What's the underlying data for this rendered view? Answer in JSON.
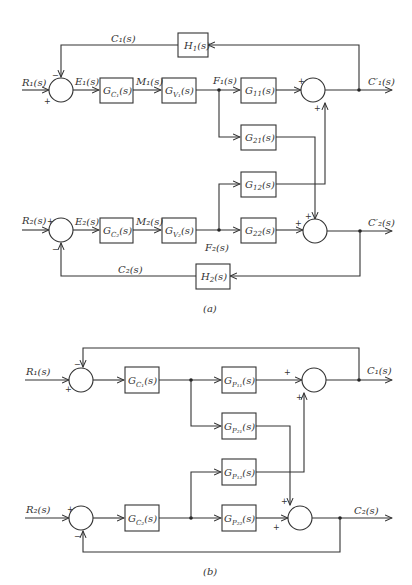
{
  "figure_a": {
    "caption": "(a)",
    "signals": {
      "R1": "R₁(s)",
      "R2": "R₂(s)",
      "E1": "E₁(s)",
      "E2": "E₂(s)",
      "M1": "M₁(s)",
      "M2": "M₂(s)",
      "F1": "F₁(s)",
      "F2": "F₂(s)",
      "C1": "C₁(s)",
      "C2": "C₂(s)",
      "C1p": "C′₁(s)",
      "C2p": "C′₂(s)"
    },
    "blocks": {
      "H1": {
        "main": "H",
        "sub": "1",
        "tail": "(s)"
      },
      "H2": {
        "main": "H",
        "sub": "2",
        "tail": "(s)"
      },
      "GC1": {
        "main": "G",
        "sub": "C₁",
        "tail": "(s)"
      },
      "GC2": {
        "main": "G",
        "sub": "C₂",
        "tail": "(s)"
      },
      "GV1": {
        "main": "G",
        "sub": "V₁",
        "tail": "(s)"
      },
      "GV2": {
        "main": "G",
        "sub": "V₂",
        "tail": "(s)"
      },
      "G11": {
        "main": "G",
        "sub": "11",
        "tail": "(s)"
      },
      "G21": {
        "main": "G",
        "sub": "21",
        "tail": "(s)"
      },
      "G12": {
        "main": "G",
        "sub": "12",
        "tail": "(s)"
      },
      "G22": {
        "main": "G",
        "sub": "22",
        "tail": "(s)"
      }
    },
    "signs": {
      "plus": "+",
      "minus": "−"
    }
  },
  "figure_b": {
    "caption": "(b)",
    "signals": {
      "R1": "R₁(s)",
      "R2": "R₂(s)",
      "C1": "C₁(s)",
      "C2": "C₂(s)"
    },
    "blocks": {
      "GC1": {
        "main": "G",
        "sub": "C₁",
        "tail": "(s)"
      },
      "GC2": {
        "main": "G",
        "sub": "C₂",
        "tail": "(s)"
      },
      "GP11": {
        "main": "G",
        "sub": "P₁₁",
        "tail": "(s)"
      },
      "GP21": {
        "main": "G",
        "sub": "P₂₁",
        "tail": "(s)"
      },
      "GP12": {
        "main": "G",
        "sub": "P₁₂",
        "tail": "(s)"
      },
      "GP22": {
        "main": "G",
        "sub": "P₂₂",
        "tail": "(s)"
      }
    },
    "signs": {
      "plus": "+",
      "minus": "−"
    }
  }
}
